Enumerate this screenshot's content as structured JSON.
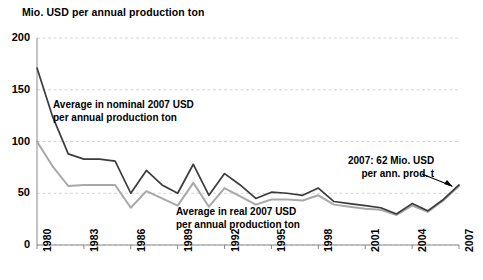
{
  "chart_data": {
    "type": "line",
    "title": "Mio. USD per annual production ton",
    "xlabel": "",
    "ylabel": "Mio. USD per annual production ton",
    "ylim": [
      0,
      200
    ],
    "yticks": [
      0,
      50,
      100,
      150,
      200
    ],
    "xlim": [
      1980,
      2007
    ],
    "xticks": [
      1980,
      1983,
      1986,
      1989,
      1992,
      1995,
      1998,
      2001,
      2004,
      2007
    ],
    "x": [
      1980,
      1981,
      1982,
      1983,
      1984,
      1985,
      1986,
      1987,
      1988,
      1989,
      1990,
      1991,
      1992,
      1993,
      1994,
      1995,
      1996,
      1997,
      1998,
      1999,
      2000,
      2001,
      2002,
      2003,
      2004,
      2005,
      2006,
      2007
    ],
    "grid": true,
    "legend_position": "inline-annotations",
    "series": [
      {
        "name": "Average in nominal 2007 USD per annual production ton",
        "color": "#3b3b3b",
        "values": [
          171,
          124,
          88,
          83,
          83,
          81,
          50,
          72,
          58,
          50,
          78,
          48,
          69,
          58,
          45,
          51,
          50,
          48,
          55,
          42,
          40,
          38,
          36,
          30,
          40,
          33,
          44,
          58
        ]
      },
      {
        "name": "Average in real 2007 USD per annual production ton",
        "color": "#a8a8a8",
        "values": [
          100,
          76,
          57,
          58,
          58,
          58,
          36,
          52,
          45,
          38,
          60,
          37,
          55,
          47,
          39,
          44,
          44,
          43,
          48,
          39,
          37,
          35,
          34,
          29,
          38,
          32,
          43,
          57
        ]
      }
    ],
    "annotations": [
      {
        "name": "nominal-series-label",
        "text": "Average in  nominal 2007 USD\nper annual production ton"
      },
      {
        "name": "real-series-label",
        "text": "Average in  real 2007 USD\nper annual production ton"
      },
      {
        "name": "endpoint-callout",
        "text": "2007: 62 Mio. USD\nper ann. prod. t"
      }
    ]
  },
  "axis": {
    "y_labels": [
      "200",
      "150",
      "100",
      "50",
      "0"
    ],
    "x_labels": [
      "1980",
      "1983",
      "1986",
      "1989",
      "1992",
      "1995",
      "1998",
      "2001",
      "2004",
      "2007"
    ]
  },
  "colors": {
    "nominal_line": "#3b3b3b",
    "real_line": "#a8a8a8",
    "grid": "#c9c9c9",
    "axis": "#8a8a8a",
    "text": "#000000"
  }
}
